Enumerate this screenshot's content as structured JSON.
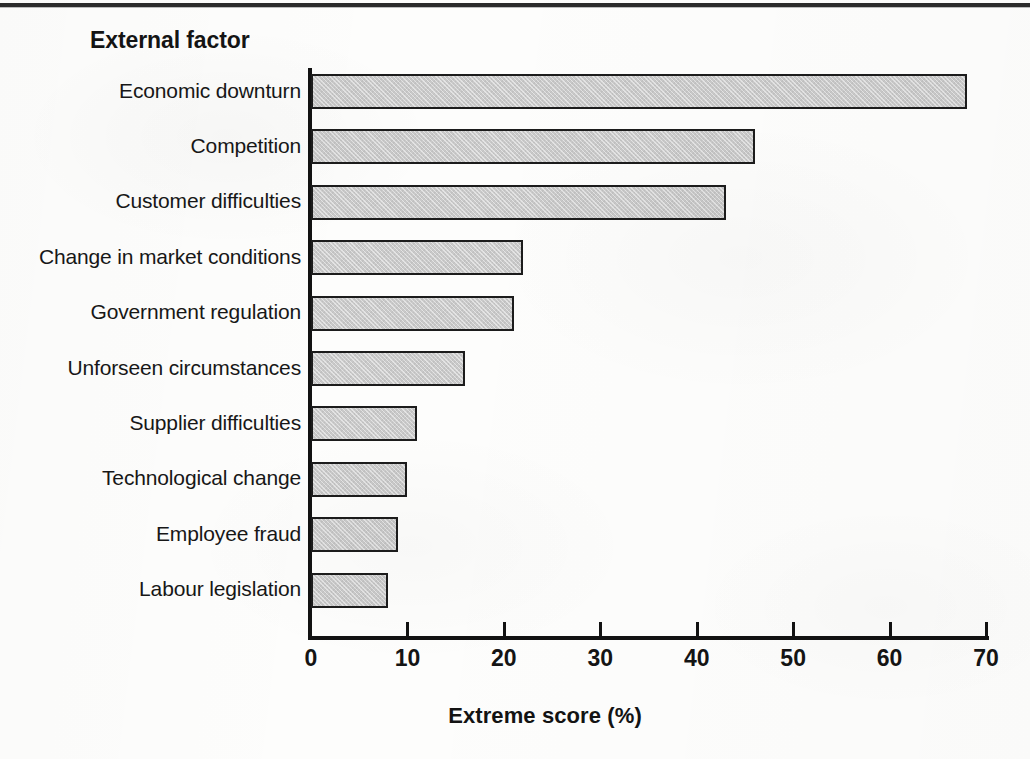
{
  "page": {
    "top_rule": "horizontal-rule"
  },
  "chart_title": "External factor",
  "x_axis_title": "Extreme score (%)",
  "chart_data": {
    "type": "bar",
    "orientation": "horizontal",
    "title": "External factor",
    "xlabel": "Extreme score (%)",
    "ylabel": "External factor",
    "xlim": [
      0,
      70
    ],
    "xticks": [
      0,
      10,
      20,
      30,
      40,
      50,
      60,
      70
    ],
    "grid": false,
    "legend": null,
    "bar_fill_color": "#c9c9c9",
    "bar_border_color": "#1c1c1c",
    "categories": [
      "Economic downturn",
      "Competition",
      "Customer difficulties",
      "Change in market conditions",
      "Government regulation",
      "Unforseen circumstances",
      "Supplier difficulties",
      "Technological change",
      "Employee fraud",
      "Labour legislation"
    ],
    "values": [
      68,
      46,
      43,
      22,
      21,
      16,
      11,
      10,
      9,
      8
    ],
    "bars": [
      {
        "label": "Economic downturn",
        "value": 68
      },
      {
        "label": "Competition",
        "value": 46
      },
      {
        "label": "Customer difficulties",
        "value": 43
      },
      {
        "label": "Change in market conditions",
        "value": 22
      },
      {
        "label": "Government regulation",
        "value": 21
      },
      {
        "label": "Unforseen circumstances",
        "value": 16
      },
      {
        "label": "Supplier difficulties",
        "value": 11
      },
      {
        "label": "Technological change",
        "value": 10
      },
      {
        "label": "Employee fraud",
        "value": 9
      },
      {
        "label": "Labour legislation",
        "value": 8
      }
    ]
  }
}
